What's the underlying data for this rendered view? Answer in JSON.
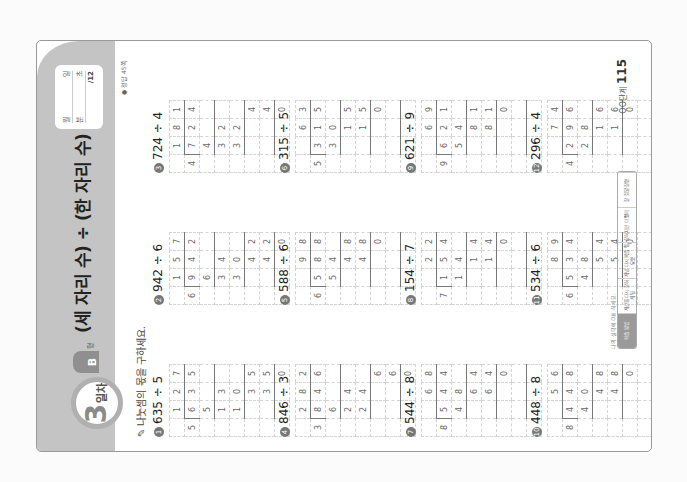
{
  "header": {
    "day_number": "3",
    "day_label": "일차",
    "level": "B",
    "level_suffix": "형",
    "title": "(세 자리 수) ÷ (한 자리 수)",
    "score": {
      "date": [
        "월",
        "일"
      ],
      "time": [
        "분",
        "초"
      ],
      "total": "/12"
    },
    "answer_ref": "● 정답 45쪽"
  },
  "instruction": "나눗셈의 몫을 구하세요.",
  "problems": [
    {
      "n": "1",
      "expr": "635 ÷ 5",
      "divisor": "5",
      "dividend": [
        "6",
        "3",
        "5"
      ],
      "quotient": [
        "1",
        "2",
        "7"
      ],
      "steps": [
        [
          "",
          "5",
          "",
          ""
        ],
        [
          "",
          "1",
          "3",
          ""
        ],
        [
          "",
          "1",
          "0",
          ""
        ],
        [
          "",
          "",
          "3",
          "5"
        ],
        [
          "",
          "",
          "3",
          "5"
        ],
        [
          "",
          "",
          "",
          "0"
        ]
      ]
    },
    {
      "n": "2",
      "expr": "942 ÷ 6",
      "divisor": "6",
      "dividend": [
        "9",
        "4",
        "2"
      ],
      "quotient": [
        "1",
        "5",
        "7"
      ],
      "steps": [
        [
          "",
          "6",
          "",
          ""
        ],
        [
          "",
          "3",
          "4",
          ""
        ],
        [
          "",
          "3",
          "0",
          ""
        ],
        [
          "",
          "",
          "4",
          "2"
        ],
        [
          "",
          "",
          "4",
          "2"
        ],
        [
          "",
          "",
          "",
          "0"
        ]
      ]
    },
    {
      "n": "3",
      "expr": "724 ÷ 4",
      "divisor": "4",
      "dividend": [
        "7",
        "2",
        "4"
      ],
      "quotient": [
        "1",
        "8",
        "1"
      ],
      "steps": [
        [
          "",
          "4",
          "",
          ""
        ],
        [
          "",
          "3",
          "2",
          ""
        ],
        [
          "",
          "3",
          "2",
          ""
        ],
        [
          "",
          "",
          "",
          "4"
        ],
        [
          "",
          "",
          "",
          "4"
        ],
        [
          "",
          "",
          "",
          "0"
        ]
      ]
    },
    {
      "n": "4",
      "expr": "846 ÷ 3",
      "divisor": "3",
      "dividend": [
        "8",
        "4",
        "6"
      ],
      "quotient": [
        "2",
        "8",
        "2"
      ],
      "steps": [
        [
          "",
          "6",
          "",
          ""
        ],
        [
          "",
          "2",
          "4",
          ""
        ],
        [
          "",
          "2",
          "4",
          ""
        ],
        [
          "",
          "",
          "",
          "6"
        ],
        [
          "",
          "",
          "",
          "6"
        ],
        [
          "",
          "",
          "",
          "0"
        ]
      ]
    },
    {
      "n": "5",
      "expr": "588 ÷ 6",
      "divisor": "6",
      "dividend": [
        "5",
        "8",
        "8"
      ],
      "quotient": [
        "",
        "9",
        "8"
      ],
      "steps": [
        [
          "",
          "5",
          "4",
          ""
        ],
        [
          "",
          "",
          "4",
          "8"
        ],
        [
          "",
          "",
          "4",
          "8"
        ],
        [
          "",
          "",
          "",
          "0"
        ],
        [
          "",
          "",
          "",
          ""
        ],
        [
          "",
          "",
          "",
          ""
        ]
      ]
    },
    {
      "n": "6",
      "expr": "315 ÷ 5",
      "divisor": "5",
      "dividend": [
        "3",
        "1",
        "5"
      ],
      "quotient": [
        "",
        "6",
        "3"
      ],
      "steps": [
        [
          "",
          "3",
          "0",
          ""
        ],
        [
          "",
          "",
          "1",
          "5"
        ],
        [
          "",
          "",
          "1",
          "5"
        ],
        [
          "",
          "",
          "",
          "0"
        ],
        [
          "",
          "",
          "",
          ""
        ],
        [
          "",
          "",
          "",
          ""
        ]
      ]
    },
    {
      "n": "7",
      "expr": "544 ÷ 8",
      "divisor": "8",
      "dividend": [
        "5",
        "4",
        "4"
      ],
      "quotient": [
        "",
        "6",
        "8"
      ],
      "steps": [
        [
          "",
          "4",
          "8",
          ""
        ],
        [
          "",
          "",
          "6",
          "4"
        ],
        [
          "",
          "",
          "6",
          "4"
        ],
        [
          "",
          "",
          "",
          "0"
        ],
        [
          "",
          "",
          "",
          ""
        ],
        [
          "",
          "",
          "",
          ""
        ]
      ]
    },
    {
      "n": "8",
      "expr": "154 ÷ 7",
      "divisor": "7",
      "dividend": [
        "1",
        "5",
        "4"
      ],
      "quotient": [
        "",
        "2",
        "2"
      ],
      "steps": [
        [
          "",
          "1",
          "4",
          ""
        ],
        [
          "",
          "",
          "1",
          "4"
        ],
        [
          "",
          "",
          "1",
          "4"
        ],
        [
          "",
          "",
          "",
          "0"
        ],
        [
          "",
          "",
          "",
          ""
        ],
        [
          "",
          "",
          "",
          ""
        ]
      ]
    },
    {
      "n": "9",
      "expr": "621 ÷ 9",
      "divisor": "9",
      "dividend": [
        "6",
        "2",
        "1"
      ],
      "quotient": [
        "",
        "6",
        "9"
      ],
      "steps": [
        [
          "",
          "5",
          "4",
          ""
        ],
        [
          "",
          "",
          "8",
          "1"
        ],
        [
          "",
          "",
          "8",
          "1"
        ],
        [
          "",
          "",
          "",
          "0"
        ],
        [
          "",
          "",
          "",
          ""
        ],
        [
          "",
          "",
          "",
          ""
        ]
      ]
    },
    {
      "n": "10",
      "expr": "448 ÷ 8",
      "divisor": "8",
      "dividend": [
        "4",
        "4",
        "8"
      ],
      "quotient": [
        "",
        "5",
        "6"
      ],
      "steps": [
        [
          "",
          "4",
          "0",
          ""
        ],
        [
          "",
          "",
          "4",
          "8"
        ],
        [
          "",
          "",
          "4",
          "8"
        ],
        [
          "",
          "",
          "",
          "0"
        ],
        [
          "",
          "",
          "",
          ""
        ],
        [
          "",
          "",
          "",
          ""
        ]
      ]
    },
    {
      "n": "11",
      "expr": "534 ÷ 6",
      "divisor": "6",
      "dividend": [
        "5",
        "3",
        "4"
      ],
      "quotient": [
        "",
        "8",
        "9"
      ],
      "steps": [
        [
          "",
          "4",
          "8",
          ""
        ],
        [
          "",
          "",
          "5",
          "4"
        ],
        [
          "",
          "",
          "5",
          "4"
        ],
        [
          "",
          "",
          "",
          "0"
        ],
        [
          "",
          "",
          "",
          ""
        ],
        [
          "",
          "",
          "",
          ""
        ]
      ]
    },
    {
      "n": "12",
      "expr": "296 ÷ 4",
      "divisor": "4",
      "dividend": [
        "2",
        "9",
        "6"
      ],
      "quotient": [
        "",
        "7",
        "4"
      ],
      "steps": [
        [
          "",
          "2",
          "8",
          ""
        ],
        [
          "",
          "",
          "1",
          "6"
        ],
        [
          "",
          "",
          "1",
          "6"
        ],
        [
          "",
          "",
          "",
          "0"
        ],
        [
          "",
          "",
          "",
          ""
        ],
        [
          "",
          "",
          "",
          ""
        ]
      ]
    }
  ],
  "footer": {
    "hint": "나의 실력에 O표 하세요.",
    "strip": [
      "학습 방법",
      "계산을 다시 잘하게 됨",
      "개념 다시 복습 필요함",
      "잘하지만 더 빨리",
      "잘 정말 잘함"
    ],
    "page_label": "OO단계",
    "page_number": "115"
  }
}
